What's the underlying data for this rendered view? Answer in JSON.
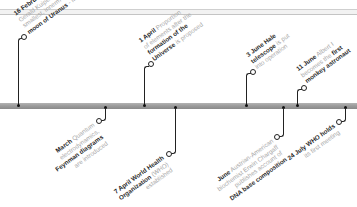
{
  "timeline": {
    "colors": {
      "bar": "#9a9a9a",
      "stem": "#222222",
      "text_muted": "#a8a8a8",
      "text_bold": "#2b2b2b"
    },
    "events_above": [
      {
        "date": "16 February",
        "lines": [
          "Dutch astronomer",
          "Gerald Kuiper discovers",
          "smallest, innermost",
          "moon of Uranus - Miranda"
        ],
        "bold": "moon of Uranus"
      },
      {
        "date": "1 April",
        "lines": [
          "Proportion",
          "of elements after the",
          "formation of the",
          "Universe is proposed"
        ],
        "bold": "formation of the Universe"
      },
      {
        "date": "3 June",
        "lines": [
          "Hale",
          "telescope is put",
          "into operation"
        ],
        "bold": "Hale telescope"
      },
      {
        "date": "11 June",
        "lines": [
          "Albert I",
          "becomes the first",
          "monkey astronaut"
        ],
        "bold": "first monkey astronaut"
      }
    ],
    "events_below": [
      {
        "date": "March",
        "lines": [
          "Quantum",
          "electrodynamics,",
          "Feynman diagrams",
          "are introduced"
        ],
        "bold": "Feynman diagrams"
      },
      {
        "date": "7 April",
        "lines": [
          "World Health",
          "Organization (WHO)",
          "established"
        ],
        "bold": "World Health Organization"
      },
      {
        "date": "June",
        "lines": [
          "Austrian-American",
          "biochemist Erwin Chargaff",
          "publishes account of",
          "DNA base composition"
        ],
        "bold": "DNA base composition"
      },
      {
        "date": "24 July",
        "lines": [
          "WHO holds",
          "its first meeting"
        ],
        "bold": "WHO"
      }
    ]
  }
}
